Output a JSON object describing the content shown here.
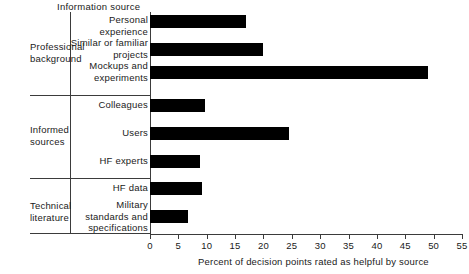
{
  "header": {
    "title": "Information source"
  },
  "groups": [
    {
      "name": "Professional background",
      "line1": "Professional",
      "line2": "background"
    },
    {
      "name": "Informed sources",
      "line1": "Informed",
      "line2": "sources"
    },
    {
      "name": "Technical literature",
      "line1": "Technical",
      "line2": "literature"
    }
  ],
  "axis": {
    "title": "Percent of decision points rated as helpful by source",
    "ticks": [
      "0",
      "5",
      "10",
      "15",
      "20",
      "25",
      "30",
      "35",
      "40",
      "45",
      "50",
      "55"
    ]
  },
  "chart_data": {
    "type": "bar",
    "orientation": "horizontal",
    "title": "",
    "xlabel": "Percent of decision points rated as helpful by source",
    "ylabel": "Information source",
    "xlim": [
      0,
      55
    ],
    "xticks": [
      0,
      5,
      10,
      15,
      20,
      25,
      30,
      35,
      40,
      45,
      50,
      55
    ],
    "grid": false,
    "legend": null,
    "bar_color": "#000000",
    "categories": [
      "Personal experience",
      "Similar or familiar projects",
      "Mockups and experiments",
      "Colleagues",
      "Users",
      "HF experts",
      "HF data",
      "Military standards and specifications"
    ],
    "category_lines": [
      [
        "Personal",
        "experience"
      ],
      [
        "Similar or familiar",
        "projects"
      ],
      [
        "Mockups and",
        "experiments"
      ],
      [
        "Colleagues"
      ],
      [
        "Users"
      ],
      [
        "HF experts"
      ],
      [
        "HF data"
      ],
      [
        "Military",
        "standards and",
        "specifications"
      ]
    ],
    "groups": [
      {
        "label": "Professional background",
        "categories": [
          "Personal experience",
          "Similar or familiar projects",
          "Mockups and experiments"
        ]
      },
      {
        "label": "Informed sources",
        "categories": [
          "Colleagues",
          "Users",
          "HF experts"
        ]
      },
      {
        "label": "Technical literature",
        "categories": [
          "HF data",
          "Military standards and specifications"
        ]
      }
    ],
    "values": [
      17,
      20,
      49,
      9.7,
      24.5,
      8.8,
      9.2,
      6.7
    ]
  }
}
